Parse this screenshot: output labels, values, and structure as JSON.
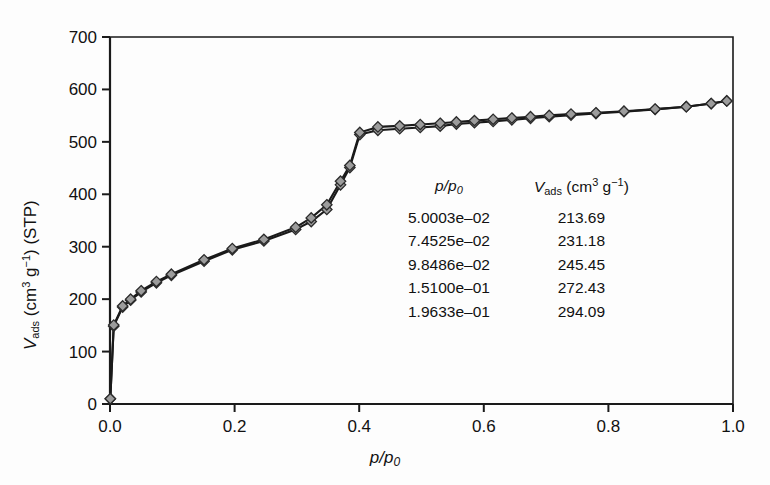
{
  "figure": {
    "background_color": "#fdfdfd",
    "axis_color": "#1a1a1a",
    "curve_color": "#1a1a1a",
    "marker_fill": "#9c9c9c",
    "marker_edge": "#2b2b2b"
  },
  "axes": {
    "x_title_main": "p/p",
    "x_title_sub": "0",
    "y_title": {
      "symbol": "V",
      "symbol_sub": "ads",
      "unit_open": " (cm",
      "unit_sup1": "3",
      "unit_mid": " g",
      "unit_sup2": "−1",
      "unit_close": ") (STP)"
    },
    "x_ticks": [
      "0.0",
      "0.2",
      "0.4",
      "0.6",
      "0.8",
      "1.0"
    ],
    "y_ticks": [
      "0",
      "100",
      "200",
      "300",
      "400",
      "500",
      "600",
      "700"
    ]
  },
  "table": {
    "header_x_main": "p/p",
    "header_x_sub": "0",
    "header_y_symbol": "V",
    "header_y_sub": "ads",
    "header_y_unit_open": " (cm",
    "header_y_sup1": "3",
    "header_y_unit_mid": " g",
    "header_y_sup2": "−1",
    "header_y_unit_close": ")",
    "rows": [
      {
        "x": "5.0003e–02",
        "v": "213.69"
      },
      {
        "x": "7.4525e–02",
        "v": "231.18"
      },
      {
        "x": "9.8486e–02",
        "v": "245.45"
      },
      {
        "x": "1.5100e–01",
        "v": "272.43"
      },
      {
        "x": "1.9633e–01",
        "v": "294.09"
      }
    ]
  },
  "chart_data": {
    "type": "line",
    "title": "",
    "xlabel": "p/p0",
    "ylabel": "Vads (cm3 g-1) (STP)",
    "xlim": [
      0.0,
      1.0
    ],
    "ylim": [
      0,
      700
    ],
    "x_tick_values": [
      0.0,
      0.2,
      0.4,
      0.6,
      0.8,
      1.0
    ],
    "y_tick_values": [
      0,
      100,
      200,
      300,
      400,
      500,
      600,
      700
    ],
    "grid": false,
    "legend": "none",
    "marker": "diamond",
    "annotation_table": {
      "columns": [
        "p/p0",
        "Vads (cm3 g-1)"
      ],
      "rows": [
        [
          0.050003,
          213.69
        ],
        [
          0.074525,
          231.18
        ],
        [
          0.098486,
          245.45
        ],
        [
          0.151,
          272.43
        ],
        [
          0.19633,
          294.09
        ]
      ]
    },
    "series": [
      {
        "name": "adsorption",
        "x": [
          0.0005,
          0.006,
          0.0203,
          0.0331,
          0.050003,
          0.074525,
          0.098486,
          0.151,
          0.19633,
          0.247,
          0.298,
          0.323,
          0.348,
          0.37,
          0.385,
          0.401,
          0.43,
          0.465,
          0.498,
          0.53,
          0.556,
          0.585,
          0.615,
          0.645,
          0.675,
          0.705,
          0.74,
          0.78,
          0.825,
          0.875,
          0.925,
          0.965,
          0.99
        ],
        "y": [
          10.0,
          148.5,
          185.0,
          198.0,
          213.69,
          231.18,
          245.45,
          272.43,
          294.09,
          311.0,
          333.0,
          348.0,
          371.0,
          418.0,
          451.0,
          514.0,
          522.0,
          525.0,
          527.5,
          530.0,
          534.0,
          536.5,
          539.0,
          542.0,
          545.0,
          548.0,
          551.0,
          554.0,
          557.5,
          562.0,
          567.0,
          573.0,
          578.0
        ]
      },
      {
        "name": "desorption",
        "x": [
          0.99,
          0.965,
          0.925,
          0.875,
          0.825,
          0.78,
          0.74,
          0.705,
          0.675,
          0.645,
          0.615,
          0.585,
          0.556,
          0.53,
          0.498,
          0.465,
          0.43,
          0.401,
          0.385,
          0.37,
          0.348,
          0.323,
          0.298,
          0.247,
          0.19633,
          0.151,
          0.098486,
          0.074525,
          0.050003,
          0.0331,
          0.0203,
          0.006,
          0.0005
        ],
        "y": [
          578.0,
          573.0,
          567.0,
          562.5,
          558.5,
          555.5,
          553.0,
          550.5,
          548.0,
          545.5,
          543.0,
          540.5,
          538.0,
          535.5,
          533.0,
          530.5,
          528.5,
          518.0,
          455.0,
          425.0,
          380.0,
          355.0,
          337.0,
          314.0,
          296.5,
          275.0,
          247.5,
          233.5,
          216.0,
          200.0,
          187.0,
          150.5,
          10.0
        ]
      }
    ]
  }
}
